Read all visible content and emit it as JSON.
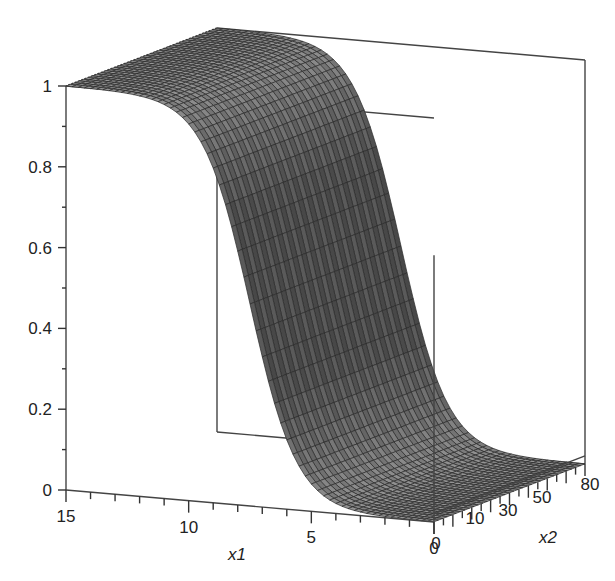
{
  "chart_data": {
    "type": "surface3d",
    "title": "",
    "function": "z = 1 / (1 + exp(-(x1 - 7.5)))  (logistic sigmoid along x1, constant along x2, drawn as mesh)",
    "xlabel": "x1",
    "ylabel": "x2",
    "zlabel": "",
    "x1_range": [
      0,
      15
    ],
    "x2_range": [
      0,
      80
    ],
    "z_range": [
      0,
      1
    ],
    "x1_ticks": [
      15,
      10,
      5,
      0
    ],
    "x1_tick_labels": [
      "15",
      "10",
      "5",
      "0"
    ],
    "x2_ticks": [
      0,
      10,
      30,
      50,
      80
    ],
    "x2_tick_labels": [
      "0",
      "10",
      "30",
      "50",
      "80"
    ],
    "z_ticks": [
      0,
      0.2,
      0.4,
      0.6,
      0.8,
      1
    ],
    "z_tick_labels": [
      "0",
      "0.2",
      "0.4",
      "0.6",
      "0.8",
      "1"
    ],
    "sample_points": [
      {
        "x1": 0,
        "z": 0.001
      },
      {
        "x1": 2.5,
        "z": 0.007
      },
      {
        "x1": 5,
        "z": 0.076
      },
      {
        "x1": 6,
        "z": 0.18
      },
      {
        "x1": 7,
        "z": 0.38
      },
      {
        "x1": 7.5,
        "z": 0.5
      },
      {
        "x1": 8,
        "z": 0.62
      },
      {
        "x1": 9,
        "z": 0.82
      },
      {
        "x1": 10,
        "z": 0.92
      },
      {
        "x1": 12.5,
        "z": 0.993
      },
      {
        "x1": 15,
        "z": 0.999
      }
    ],
    "grid": false,
    "box": true,
    "colors": {
      "surface_fill": "#9a9a9a",
      "mesh_line": "#2a2a2a",
      "box_line": "#444444"
    }
  }
}
